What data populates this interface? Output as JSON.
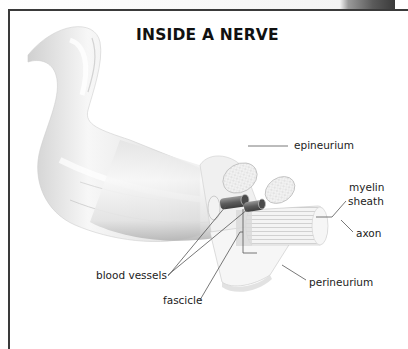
{
  "title": "INSIDE A NERVE",
  "labels": {
    "epineurium": "epineurium",
    "myelin": "myelin",
    "sheath": "sheath",
    "axon": "axon",
    "blood_vessels": "blood vessels",
    "fascicle": "fascicle",
    "perineurium": "perineurium"
  },
  "colors": {
    "frame": "#3a3a3a",
    "text": "#222222",
    "leader_line": "#555555",
    "nerve_light": "#f3f3f3",
    "nerve_shade": "#bdbdbd",
    "vessel": "#6a6a6a"
  }
}
